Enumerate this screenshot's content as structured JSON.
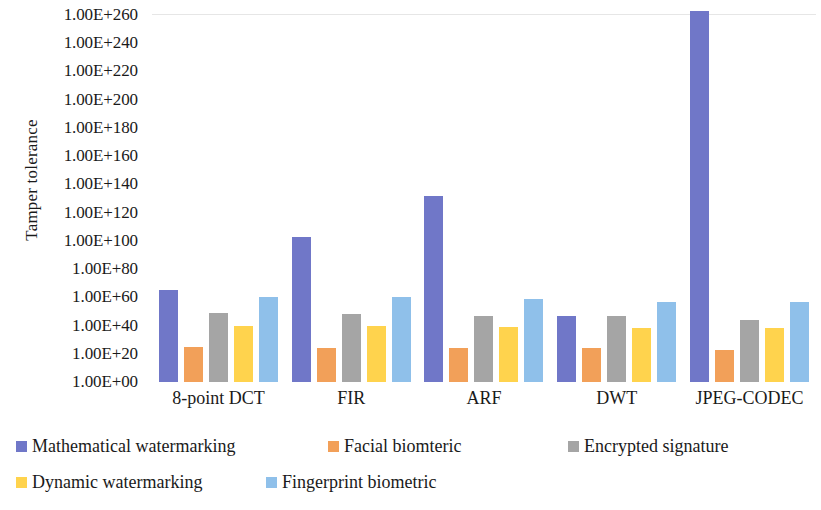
{
  "chart_data": {
    "type": "bar",
    "title": "",
    "xlabel": "",
    "ylabel": "Tamper tolerance",
    "yscale": "log",
    "ylim": [
      1,
      1e+260
    ],
    "grid": false,
    "legend_position": "bottom",
    "categories": [
      "8-point DCT",
      "FIR",
      "ARF",
      "DWT",
      "JPEG-CODEC"
    ],
    "y_tick_labels": [
      "1.00E+260",
      "1.00E+240",
      "1.00E+220",
      "1.00E+200",
      "1.00E+180",
      "1.00E+160",
      "1.00E+140",
      "1.00E+120",
      "1.00E+100",
      "1.00E+80",
      "1.00E+60",
      "1.00E+40",
      "1.00E+20",
      "1.00E+00"
    ],
    "y_tick_exponents": [
      260,
      240,
      220,
      200,
      180,
      160,
      140,
      120,
      100,
      80,
      60,
      40,
      20,
      0
    ],
    "series": [
      {
        "name": "Mathematical watermarking",
        "color": "#7077c8",
        "exponents": [
          65,
          103,
          132,
          47,
          266
        ],
        "values": [
          "1.00E+65",
          "1.00E+103",
          "1.00E+132",
          "1.00E+47",
          "1.00E+266"
        ]
      },
      {
        "name": "Facial biomteric",
        "color": "#f2a059",
        "exponents": [
          25,
          24,
          24,
          24,
          23
        ],
        "values": [
          "1.00E+25",
          "1.00E+24",
          "1.00E+24",
          "1.00E+24",
          "1.00E+23"
        ]
      },
      {
        "name": "Encrypted signature",
        "color": "#a5a5a5",
        "exponents": [
          49,
          48,
          47,
          47,
          44
        ],
        "values": [
          "1.00E+49",
          "1.00E+48",
          "1.00E+47",
          "1.00E+47",
          "1.00E+44"
        ]
      },
      {
        "name": "Dynamic watermarking",
        "color": "#ffd34d",
        "exponents": [
          40,
          40,
          39,
          38,
          38
        ],
        "values": [
          "1.00E+40",
          "1.00E+40",
          "1.00E+39",
          "1.00E+38",
          "1.00E+38"
        ]
      },
      {
        "name": "Fingerprint biometric",
        "color": "#8fc0ea",
        "exponents": [
          60,
          60,
          59,
          57,
          57
        ],
        "values": [
          "1.00E+60",
          "1.00E+60",
          "1.00E+59",
          "1.00E+57",
          "1.00E+57"
        ]
      }
    ]
  }
}
